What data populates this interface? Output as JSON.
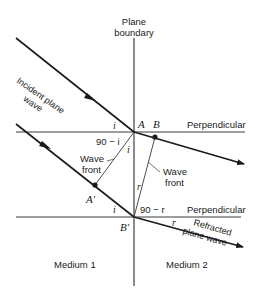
{
  "diagram": {
    "labels": {
      "plane_boundary_1": "Plane",
      "plane_boundary_2": "boundary",
      "incident_1": "Incident plane",
      "incident_2": "wave",
      "perpendicular_top": "Perpendicular",
      "perpendicular_bottom": "Perpendicular",
      "point_a": "A",
      "point_b": "B",
      "point_a_prime": "A′",
      "point_b_prime": "B′",
      "angle_i_top": "i",
      "angle_i_inner": "i",
      "angle_i_bottom": "i",
      "angle_90_minus_i": "90 − i",
      "angle_r_inner": "r",
      "angle_r_bottom": "r",
      "angle_90_minus_r": "90 − r",
      "wave_front_left_1": "Wave",
      "wave_front_left_2": "front",
      "wave_front_right_1": "Wave",
      "wave_front_right_2": "front",
      "refracted_1": "Refracted",
      "refracted_2": "plane wave",
      "medium_1": "Medium 1",
      "medium_2": "Medium 2"
    },
    "colors": {
      "line": "#1a1a1a",
      "thin_line": "#3a3a3a",
      "background": "#ffffff"
    }
  }
}
